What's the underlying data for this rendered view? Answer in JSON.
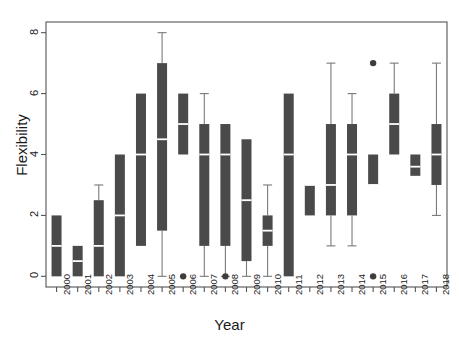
{
  "chart_data": {
    "type": "box",
    "title": "",
    "xlabel": "Year",
    "ylabel": "Flexibility",
    "ylim": [
      -0.35,
      8.35
    ],
    "yticks": [
      0,
      2,
      4,
      6,
      8
    ],
    "ytick_labels": [
      "0",
      "2",
      "4",
      "6",
      "8"
    ],
    "grid": false,
    "legend": null,
    "categories": [
      "2000",
      "2001",
      "2002",
      "2003",
      "2004",
      "2005",
      "2006",
      "2007",
      "2008",
      "2009",
      "2010",
      "2011",
      "2012",
      "2013",
      "2014",
      "2015",
      "2016",
      "2017",
      "2018"
    ],
    "boxes": [
      {
        "year": "2000",
        "whisker_low": 0,
        "q1": 0,
        "median": 1,
        "q3": 2,
        "whisker_high": 2,
        "outliers": []
      },
      {
        "year": "2001",
        "whisker_low": 0,
        "q1": 0,
        "median": 0.5,
        "q3": 1,
        "whisker_high": 1,
        "outliers": []
      },
      {
        "year": "2002",
        "whisker_low": 0,
        "q1": 0,
        "median": 1,
        "q3": 2.5,
        "whisker_high": 3,
        "outliers": []
      },
      {
        "year": "2003",
        "whisker_low": 0,
        "q1": 0,
        "median": 2,
        "q3": 4,
        "whisker_high": 4,
        "outliers": []
      },
      {
        "year": "2004",
        "whisker_low": 1,
        "q1": 1,
        "median": 4,
        "q3": 6,
        "whisker_high": 6,
        "outliers": []
      },
      {
        "year": "2005",
        "whisker_low": 0,
        "q1": 1.5,
        "median": 4.5,
        "q3": 7,
        "whisker_high": 8,
        "outliers": []
      },
      {
        "year": "2006",
        "whisker_low": 4,
        "q1": 4,
        "median": 5,
        "q3": 6,
        "whisker_high": 6,
        "outliers": [
          0
        ]
      },
      {
        "year": "2007",
        "whisker_low": 0,
        "q1": 1,
        "median": 4,
        "q3": 5,
        "whisker_high": 6,
        "outliers": []
      },
      {
        "year": "2008",
        "whisker_low": 0,
        "q1": 1,
        "median": 4,
        "q3": 5,
        "whisker_high": 5,
        "outliers": [
          0
        ]
      },
      {
        "year": "2009",
        "whisker_low": 0,
        "q1": 0.5,
        "median": 2.5,
        "q3": 4.5,
        "whisker_high": 4.5,
        "outliers": []
      },
      {
        "year": "2010",
        "whisker_low": 0,
        "q1": 1,
        "median": 1.5,
        "q3": 2,
        "whisker_high": 3,
        "outliers": []
      },
      {
        "year": "2011",
        "whisker_low": 0,
        "q1": 0,
        "median": 4,
        "q3": 6,
        "whisker_high": 6,
        "outliers": []
      },
      {
        "year": "2012",
        "whisker_low": 2,
        "q1": 2,
        "median": 3,
        "q3": 3,
        "whisker_high": 3,
        "outliers": []
      },
      {
        "year": "2013",
        "whisker_low": 1,
        "q1": 2,
        "median": 3,
        "q3": 5,
        "whisker_high": 7,
        "outliers": []
      },
      {
        "year": "2014",
        "whisker_low": 1,
        "q1": 2,
        "median": 4,
        "q3": 5,
        "whisker_high": 6,
        "outliers": []
      },
      {
        "year": "2015",
        "whisker_low": 3,
        "q1": 3,
        "median": 3,
        "q3": 4,
        "whisker_high": 4,
        "outliers": [
          7,
          0
        ]
      },
      {
        "year": "2016",
        "whisker_low": 4,
        "q1": 4,
        "median": 5,
        "q3": 6,
        "whisker_high": 7,
        "outliers": []
      },
      {
        "year": "2017",
        "whisker_low": 3.3,
        "q1": 3.3,
        "median": 3.6,
        "q3": 4,
        "whisker_high": 4,
        "outliers": []
      },
      {
        "year": "2018",
        "whisker_low": 2,
        "q1": 3,
        "median": 4,
        "q3": 5,
        "whisker_high": 7,
        "outliers": []
      }
    ],
    "style": {
      "box_fill": "#4a4a4a",
      "median_color": "#ffffff",
      "whisker_color": "#7a7a7a",
      "outlier_color": "#3d3d3d",
      "axis_color": "#555555",
      "background": "#ffffff"
    }
  }
}
